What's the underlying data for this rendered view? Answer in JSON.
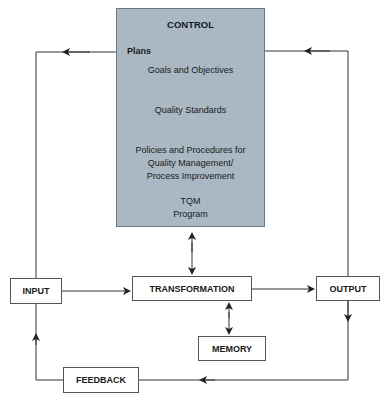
{
  "diagram": {
    "control": {
      "title": "CONTROL",
      "plans_label": "Plans",
      "steps": [
        "Goals and Objectives",
        "Quality Standards",
        "Policies and Procedures for Quality Management/ Process Improvement",
        "TQM Program"
      ],
      "steps_display": {
        "goals": "Goals and Objectives",
        "standards": "Quality Standards",
        "policies_1": "Policies and Procedures for",
        "policies_2": "Quality Management/",
        "policies_3": "Process Improvement",
        "tqm_1": "TQM",
        "tqm_2": "Program"
      },
      "fill_color": "#a9b8c3"
    },
    "nodes": {
      "input": "INPUT",
      "transformation": "TRANSFORMATION",
      "output": "OUTPUT",
      "memory": "MEMORY",
      "feedback": "FEEDBACK"
    },
    "edges": [
      {
        "from": "INPUT",
        "to": "TRANSFORMATION"
      },
      {
        "from": "TRANSFORMATION",
        "to": "OUTPUT"
      },
      {
        "from": "CONTROL",
        "to": "TRANSFORMATION",
        "bidirectional": true
      },
      {
        "from": "TRANSFORMATION",
        "to": "MEMORY",
        "bidirectional": true
      },
      {
        "from": "OUTPUT",
        "to": "FEEDBACK"
      },
      {
        "from": "FEEDBACK",
        "to": "INPUT"
      },
      {
        "from": "INPUT",
        "to": "CONTROL"
      },
      {
        "from": "OUTPUT",
        "to": "CONTROL"
      }
    ]
  }
}
